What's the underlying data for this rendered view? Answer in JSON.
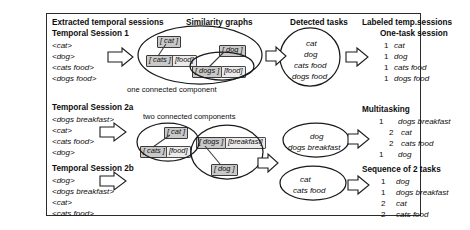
{
  "figure": {
    "columns": {
      "extracted": "Extracted temporal sessions",
      "graphs": "Similarity graphs",
      "detected": "Detected tasks",
      "labeled": "Labeled temp.sessions"
    },
    "captions": {
      "one_component": "one connected component",
      "two_components": "two connected components"
    }
  },
  "sessions": [
    {
      "title": "Temporal Session 1",
      "items": [
        "<cat>",
        "<dog>",
        "<cats food>",
        "<dogs food>"
      ]
    },
    {
      "title": "Temporal Session 2a",
      "items": [
        "<dogs breakfast>",
        "<cat>",
        "<cats food>",
        "<dog>"
      ]
    },
    {
      "title": "Temporal Session 2b",
      "items": [
        "<dog>",
        "<dogs breakfast>",
        "<cat>",
        "<cats food>"
      ]
    }
  ],
  "graphs": [
    {
      "name": "similarity-graph-session-1",
      "nodes": [
        "[ cat ]",
        "[ cats ]",
        "[food]",
        "[ dog ]",
        "[ dogs ]",
        "[food]"
      ]
    },
    {
      "name": "similarity-graph-session-2-component-a",
      "nodes": [
        "[ cat ]",
        "[ cats ]",
        "[food]"
      ]
    },
    {
      "name": "similarity-graph-session-2-component-b",
      "nodes": [
        "[ dogs ]",
        "[breakfast]",
        "[ dog ]"
      ]
    }
  ],
  "detected_tasks": [
    {
      "name": "detected-tasks-session-1",
      "tasks": [
        "cat",
        "dog",
        "cats food",
        "dogs food"
      ]
    },
    {
      "name": "detected-tasks-dog-group",
      "tasks": [
        "dog",
        "dogs breakfast"
      ]
    },
    {
      "name": "detected-tasks-cat-group",
      "tasks": [
        "cat",
        "cats food"
      ]
    }
  ],
  "labeled": [
    {
      "title": "One-task session",
      "rows": [
        {
          "id": "1",
          "label": "cat"
        },
        {
          "id": "1",
          "label": "dog"
        },
        {
          "id": "1",
          "label": "cats food"
        },
        {
          "id": "1",
          "label": "dogs food"
        }
      ]
    },
    {
      "title": "Multitasking",
      "rows": [
        {
          "id": "1",
          "label": "dogs breakfast"
        },
        {
          "id": "2",
          "label": "cat"
        },
        {
          "id": "2",
          "label": "cats food"
        },
        {
          "id": "1",
          "label": "dog"
        }
      ]
    },
    {
      "title": "Sequence of 2 tasks",
      "rows": [
        {
          "id": "1",
          "label": "dog"
        },
        {
          "id": "1",
          "label": "dogs breakfast"
        },
        {
          "id": "2",
          "label": "cat"
        },
        {
          "id": "2",
          "label": "cats food"
        }
      ]
    }
  ],
  "icons": {
    "arrow": "block-arrow-right-icon"
  }
}
